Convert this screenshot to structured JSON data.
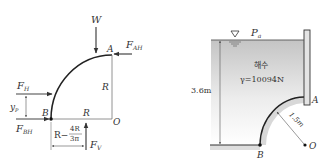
{
  "left_diagram": {
    "point_labels": {
      "A": "A",
      "B": "B",
      "O": "O"
    },
    "force_labels": {
      "W": "W",
      "F_AH": "F",
      "F_AH_sub": "AH",
      "F_H": "F",
      "F_H_sub": "H",
      "F_BH": "F",
      "F_BH_sub": "BH",
      "F_V": "F",
      "F_V_sub": "V"
    },
    "dimension_labels": {
      "R_vertical": "R",
      "R_horizontal": "R",
      "y_p": "y",
      "y_p_sub": "P",
      "offset_prefix": "R−",
      "offset_num": "4R",
      "offset_den": "3π"
    }
  },
  "right_diagram": {
    "surface_pressure": "P",
    "surface_pressure_sub": "a",
    "fluid_name": "해수",
    "specific_weight": "γ=10094N",
    "depth": "3.6m",
    "radius": "1.5m",
    "point_labels": {
      "A": "A",
      "B": "B",
      "O": "O"
    },
    "colors": {
      "water_top": "#c8c8c8",
      "water_bottom": "#ffffff",
      "gate_fill": "#dcdcdc",
      "line": "#333333"
    }
  }
}
